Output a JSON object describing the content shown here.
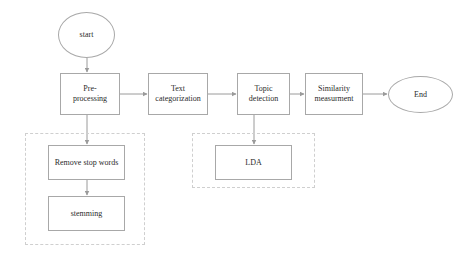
{
  "diagram": {
    "background_color": "#ffffff",
    "node_border_color": "#a8a8a8",
    "group_border_color": "#cfcfcf",
    "connector_color": "#9a9a9a",
    "text_color": "#2a2a2a"
  },
  "nodes": {
    "start": {
      "label": "start",
      "shape": "ellipse"
    },
    "preprocessing": {
      "label": "Pre-\nprocessing",
      "shape": "rectangle"
    },
    "text_categorization": {
      "label": "Text\ncategorization",
      "shape": "rectangle"
    },
    "topic_detection": {
      "label": "Topic\ndetection",
      "shape": "rectangle"
    },
    "similarity_measurement": {
      "label": "Similarity\nmeasurment",
      "shape": "rectangle"
    },
    "end": {
      "label": "End",
      "shape": "ellipse"
    },
    "remove_stop_words": {
      "label": "Remove stop words",
      "shape": "rectangle"
    },
    "stemming": {
      "label": "stemming",
      "shape": "rectangle"
    },
    "lda": {
      "label": "LDA",
      "shape": "rectangle"
    }
  },
  "groups": {
    "preprocessing_group": {
      "label": ""
    },
    "topic_detection_group": {
      "label": ""
    }
  }
}
